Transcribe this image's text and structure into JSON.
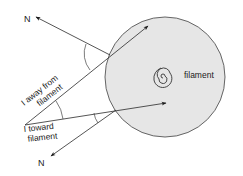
{
  "diagram": {
    "labels": {
      "n_top": "N",
      "n_bottom": "N",
      "away_line1": "I away from",
      "away_line2": "filament",
      "toward_line1": "I toward",
      "toward_line2": "filament",
      "filament": "filament"
    },
    "colors": {
      "disk_fill": "#e6e6e6",
      "stroke": "#2a2a2a",
      "text": "#1a1a1a"
    }
  }
}
